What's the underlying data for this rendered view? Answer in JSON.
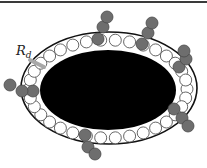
{
  "diagram": {
    "label": {
      "main": "R",
      "subscript": "d"
    },
    "colors": {
      "core": "#000000",
      "ring_fill": "#ffffff",
      "ring_stroke": "#555555",
      "chain_fill": "#6e6e6e",
      "chain_stroke": "#4a4a4a",
      "boundary": "#111111",
      "arrow": "#a8a8a8"
    },
    "outer_boundary": {
      "cx": 109,
      "cy": 88,
      "rx": 88,
      "ry": 56
    },
    "core": {
      "cx": 108,
      "cy": 90,
      "rx": 68,
      "ry": 40
    },
    "ring": {
      "cx": 108,
      "cy": 89,
      "rx": 79,
      "ry": 49,
      "count": 34,
      "r": 6
    },
    "chains": [
      [
        [
          98,
          39
        ],
        [
          103,
          27
        ],
        [
          107,
          17
        ]
      ],
      [
        [
          142,
          44
        ],
        [
          148,
          33
        ],
        [
          152,
          23
        ]
      ],
      [
        [
          179,
          67
        ],
        [
          186,
          59
        ],
        [
          184,
          51
        ]
      ],
      [
        [
          33,
          91
        ],
        [
          22,
          91
        ],
        [
          10,
          85
        ]
      ],
      [
        [
          174,
          109
        ],
        [
          182,
          118
        ],
        [
          188,
          126
        ]
      ],
      [
        [
          85,
          135
        ],
        [
          88,
          147
        ],
        [
          95,
          154
        ]
      ]
    ],
    "arrow": {
      "x1": 30,
      "y1": 60,
      "x2": 44,
      "y2": 67
    }
  }
}
